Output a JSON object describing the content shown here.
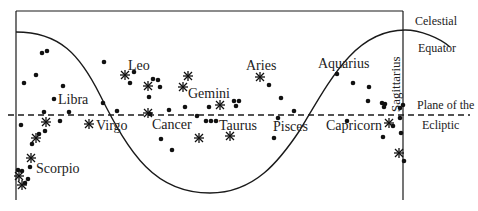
{
  "diagram": {
    "colors": {
      "ink": "#1a1a1a",
      "background": "#ffffff"
    },
    "side_labels": {
      "equator_line1": "Celestial",
      "equator_line2": "Equator",
      "ecliptic_line1": "Plane of the",
      "ecliptic_line2": "Ecliptic"
    },
    "constellations": [
      {
        "name": "Libra",
        "x": 36,
        "y": 105
      },
      {
        "name": "Virgo",
        "x": 96,
        "y": 130
      },
      {
        "name": "Leo",
        "x": 128,
        "y": 70
      },
      {
        "name": "Gemini",
        "x": 186,
        "y": 98
      },
      {
        "name": "Cancer",
        "x": 152,
        "y": 129
      },
      {
        "name": "Taurus",
        "x": 219,
        "y": 130
      },
      {
        "name": "Aries",
        "x": 246,
        "y": 70
      },
      {
        "name": "Pisces",
        "x": 273,
        "y": 132
      },
      {
        "name": "Aquarius",
        "x": 318,
        "y": 67
      },
      {
        "name": "Capricorn",
        "x": 325,
        "y": 130
      },
      {
        "name": "Scorpio",
        "x": 36,
        "y": 173
      },
      {
        "name": "Sagittarius",
        "x": 402,
        "y": 110,
        "rotated": true
      }
    ],
    "legend": {
      "dot": "star (dot)",
      "asterisk": "bright star (asterisk)"
    }
  }
}
